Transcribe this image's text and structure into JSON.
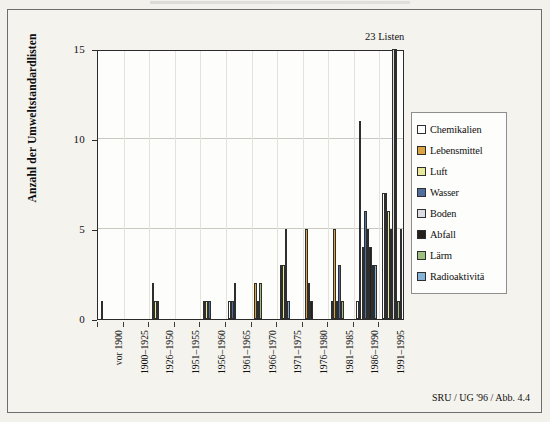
{
  "figure": {
    "y_axis_title": "Anzahl der Umweltstandardlisten",
    "annotation": "23 Listen",
    "source": "SRU / UG '96 / Abb. 4.4"
  },
  "chart_data": {
    "type": "bar",
    "title": "",
    "xlabel": "",
    "ylabel": "Anzahl der Umweltstandardlisten",
    "ylim": [
      0,
      15
    ],
    "yticks": [
      0,
      5,
      10,
      15
    ],
    "grid": true,
    "legend_position": "right",
    "annotations": [
      {
        "text": "23 Listen",
        "note": "Balken 1991-1995 (Boden/Abfall) ueberschreiten die Skala"
      }
    ],
    "categories": [
      "vor 1900",
      "1900–1925",
      "1926–1950",
      "1951–1955",
      "1956–1960",
      "1961–1965",
      "1966–1970",
      "1971–1975",
      "1976–1980",
      "1981–1985",
      "1986–1990",
      "1991–1995"
    ],
    "series": [
      {
        "name": "Chemikalien",
        "color": "#ffffff",
        "values": [
          0,
          0,
          0,
          0,
          0,
          1,
          0,
          0,
          0,
          1,
          1,
          7
        ]
      },
      {
        "name": "Lebensmittel",
        "color": "#d9a441",
        "values": [
          1,
          0,
          2,
          0,
          1,
          0,
          2,
          3,
          5,
          5,
          11,
          7
        ]
      },
      {
        "name": "Luft",
        "color": "#e8e89a",
        "values": [
          0,
          0,
          1,
          0,
          1,
          0,
          0,
          3,
          2,
          1,
          4,
          6
        ]
      },
      {
        "name": "Wasser",
        "color": "#4f6f9e",
        "values": [
          0,
          0,
          1,
          0,
          1,
          1,
          1,
          0,
          0,
          3,
          6,
          5
        ]
      },
      {
        "name": "Boden",
        "color": "#dcdce2",
        "values": [
          0,
          0,
          0,
          0,
          0,
          0,
          0,
          0,
          0,
          0,
          5,
          15
        ]
      },
      {
        "name": "Abfall",
        "color": "#24201c",
        "values": [
          0,
          0,
          0,
          0,
          0,
          0,
          0,
          0,
          1,
          0,
          4,
          15
        ]
      },
      {
        "name": "Lärm",
        "color": "#9fbf7e",
        "values": [
          0,
          0,
          0,
          0,
          0,
          2,
          2,
          5,
          0,
          1,
          3,
          1
        ]
      },
      {
        "name": "Radioaktivitä",
        "color": "#86b3d8",
        "values": [
          0,
          0,
          0,
          0,
          0,
          0,
          0,
          1,
          0,
          0,
          3,
          5
        ]
      }
    ]
  },
  "legend": {
    "items": [
      {
        "label": "Chemikalien",
        "color": "#ffffff"
      },
      {
        "label": "Lebensmittel",
        "color": "#d9a441"
      },
      {
        "label": "Luft",
        "color": "#e8e89a"
      },
      {
        "label": "Wasser",
        "color": "#4f6f9e"
      },
      {
        "label": "Boden",
        "color": "#dcdce2"
      },
      {
        "label": "Abfall",
        "color": "#24201c"
      },
      {
        "label": "Lärm",
        "color": "#9fbf7e"
      },
      {
        "label": "Radioaktivitä",
        "color": "#86b3d8"
      }
    ]
  }
}
